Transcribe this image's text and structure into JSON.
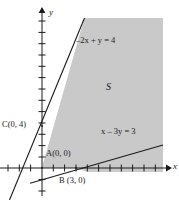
{
  "figure": {
    "type": "math-graph",
    "background_color": "#ffffff",
    "shade_color": "#c9c9c9",
    "line_color": "#1a1a1a",
    "axis_color": "#1a1a1a"
  },
  "axes": {
    "x_label": "x",
    "y_label": "y",
    "origin_px": {
      "x": 42,
      "y": 168
    },
    "unit_px": 11.3,
    "x_tick_count": 13,
    "y_tick_count": 14,
    "x_axis_y_px": 168,
    "y_axis_x_px": 42
  },
  "lines": [
    {
      "id": "line-1",
      "label": "–2x + y = 4",
      "label_plain": "-2x + y = 4",
      "equation": {
        "a": -2,
        "b": 1,
        "c": 4
      },
      "slope": 2,
      "y_intercept": 4,
      "label_pos_px": {
        "x": 76,
        "y": 36
      }
    },
    {
      "id": "line-2",
      "label": "x – 3y = 3",
      "label_plain": "x - 3y = 3",
      "equation": {
        "a": 1,
        "b": -3,
        "c": 3
      },
      "slope": 0.3333,
      "x_intercept": 3,
      "label_pos_px": {
        "x": 101,
        "y": 127
      }
    }
  ],
  "region": {
    "name": "S",
    "label": "S",
    "label_pos_px": {
      "x": 106,
      "y": 82
    },
    "fill": "#c9c9c9"
  },
  "points": [
    {
      "id": "point-a",
      "label": "A(0, 0)",
      "name": "A",
      "coords": [
        0,
        0
      ],
      "px": {
        "x": 42,
        "y": 168
      },
      "label_pos_px": {
        "x": 46,
        "y": 150
      }
    },
    {
      "id": "point-b",
      "label": "B (3, 0)",
      "name": "B",
      "coords": [
        3,
        0
      ],
      "px": {
        "x": 76,
        "y": 168
      },
      "label_pos_px": {
        "x": 59,
        "y": 176
      }
    },
    {
      "id": "point-c",
      "label": "C(0, 4)",
      "name": "C",
      "coords": [
        0,
        4
      ],
      "px": {
        "x": 42,
        "y": 126
      },
      "label_pos_px": {
        "x": 2,
        "y": 121
      }
    }
  ]
}
